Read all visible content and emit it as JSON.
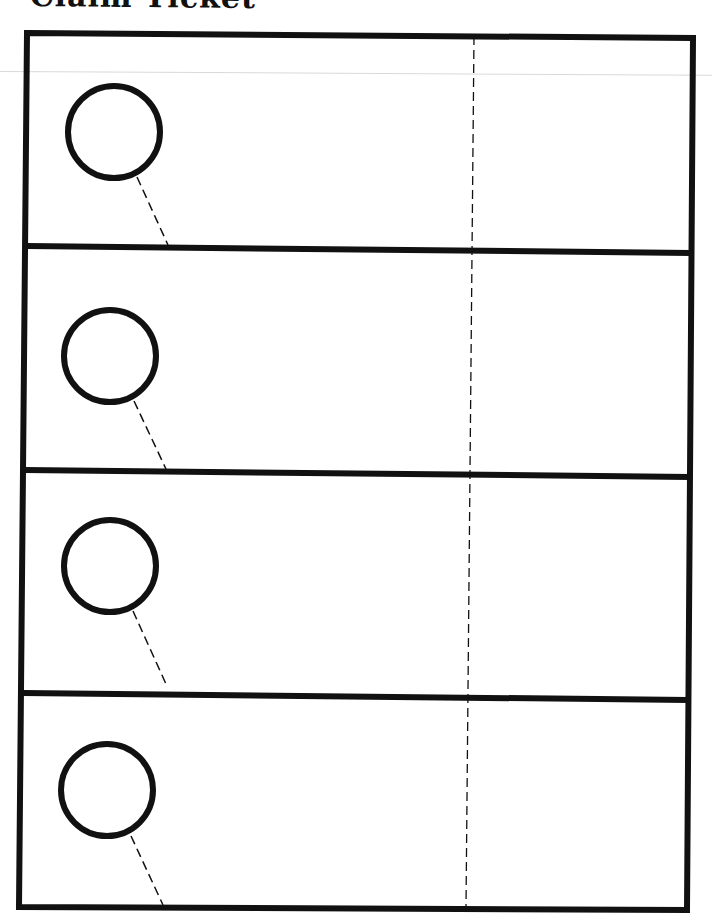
{
  "page": {
    "title": "Claim Ticket"
  },
  "colors": {
    "ink": "#111111",
    "paper": "#ffffff",
    "scan_line": "#d9d9d9"
  },
  "sheet": {
    "ticket_count": 4,
    "tickets": [
      {
        "index": 1,
        "hole": "circle-hole",
        "cut_line": "dashed"
      },
      {
        "index": 2,
        "hole": "circle-hole",
        "cut_line": "dashed"
      },
      {
        "index": 3,
        "hole": "circle-hole",
        "cut_line": "dashed"
      },
      {
        "index": 4,
        "hole": "circle-hole",
        "cut_line": "dashed"
      }
    ],
    "center_line": "dashed-vertical-cut-line"
  }
}
